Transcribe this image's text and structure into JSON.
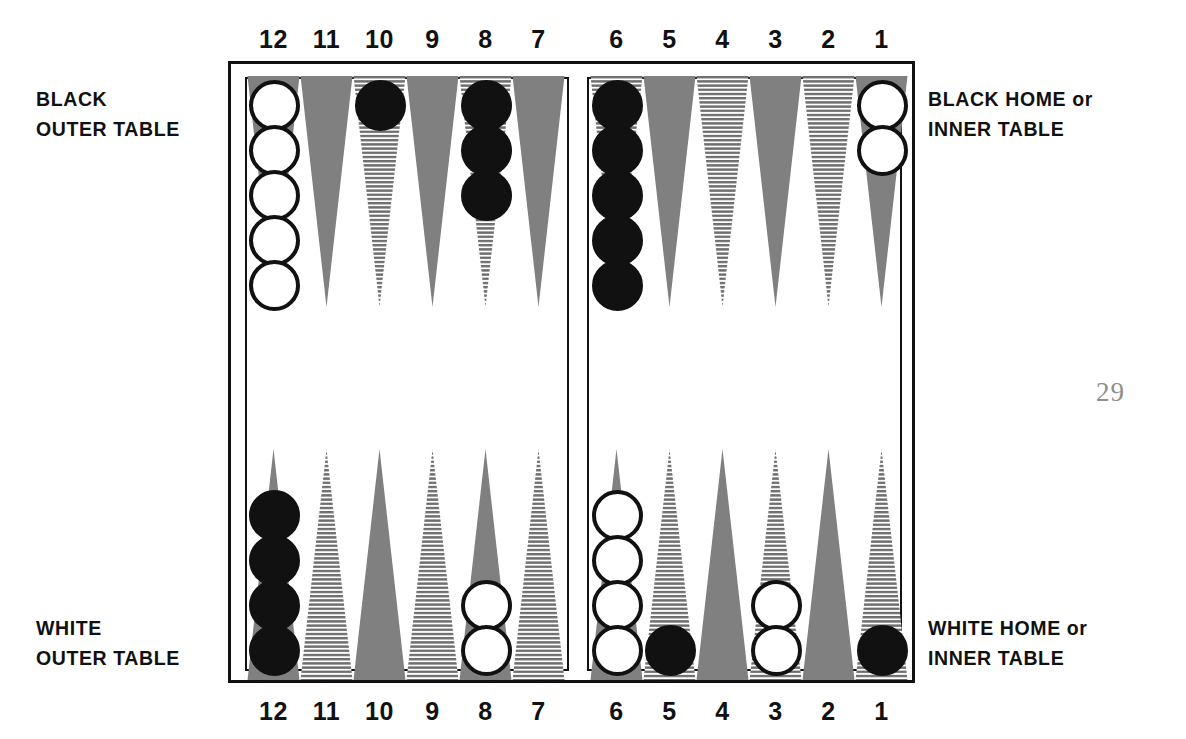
{
  "page": {
    "number": "29"
  },
  "numbers": {
    "left_quadrant": [
      "12",
      "11",
      "10",
      "9",
      "8",
      "7"
    ],
    "right_quadrant": [
      "6",
      "5",
      "4",
      "3",
      "2",
      "1"
    ]
  },
  "captions": {
    "black_outer_line1": "BLACK",
    "black_outer_line2": "OUTER TABLE",
    "black_home_line1_main": "BLACK HOME",
    "black_home_line1_or": "or",
    "black_home_line2": "INNER TABLE",
    "white_outer_line1": "WHITE",
    "white_outer_line2": "OUTER TABLE",
    "white_home_line1_main": "WHITE HOME",
    "white_home_line1_or": "or",
    "white_home_line2": "INNER TABLE"
  },
  "colors": {
    "point_solid": "#808080",
    "point_striped_line": "#6e6e6e",
    "point_striped_bg": "#ffffff",
    "checker_black": "#111111",
    "checker_white": "#ffffff",
    "outline": "#111111",
    "page_number": "#8d8d8d",
    "background": "#ffffff"
  },
  "board": {
    "quadrants": [
      {
        "name": "black-outer-table",
        "position": "top-left",
        "points": [
          {
            "number": "12",
            "fill": "solid",
            "checkers": {
              "color": "white",
              "count": 5
            }
          },
          {
            "number": "11",
            "fill": "solid",
            "checkers": {
              "color": "none",
              "count": 0
            }
          },
          {
            "number": "10",
            "fill": "striped",
            "checkers": {
              "color": "black",
              "count": 1
            }
          },
          {
            "number": "9",
            "fill": "solid",
            "checkers": {
              "color": "none",
              "count": 0
            }
          },
          {
            "number": "8",
            "fill": "striped",
            "checkers": {
              "color": "black",
              "count": 3
            }
          },
          {
            "number": "7",
            "fill": "solid",
            "checkers": {
              "color": "none",
              "count": 0
            }
          }
        ]
      },
      {
        "name": "black-home-inner-table",
        "position": "top-right",
        "points": [
          {
            "number": "6",
            "fill": "striped",
            "checkers": {
              "color": "black",
              "count": 5
            }
          },
          {
            "number": "5",
            "fill": "solid",
            "checkers": {
              "color": "none",
              "count": 0
            }
          },
          {
            "number": "4",
            "fill": "striped",
            "checkers": {
              "color": "none",
              "count": 0
            }
          },
          {
            "number": "3",
            "fill": "solid",
            "checkers": {
              "color": "none",
              "count": 0
            }
          },
          {
            "number": "2",
            "fill": "striped",
            "checkers": {
              "color": "none",
              "count": 0
            }
          },
          {
            "number": "1",
            "fill": "solid",
            "checkers": {
              "color": "white",
              "count": 2
            }
          }
        ]
      },
      {
        "name": "white-outer-table",
        "position": "bottom-left",
        "points": [
          {
            "number": "12",
            "fill": "solid",
            "checkers": {
              "color": "black",
              "count": 4
            }
          },
          {
            "number": "11",
            "fill": "striped",
            "checkers": {
              "color": "none",
              "count": 0
            }
          },
          {
            "number": "10",
            "fill": "solid",
            "checkers": {
              "color": "none",
              "count": 0
            }
          },
          {
            "number": "9",
            "fill": "striped",
            "checkers": {
              "color": "none",
              "count": 0
            }
          },
          {
            "number": "8",
            "fill": "solid",
            "checkers": {
              "color": "white",
              "count": 2
            }
          },
          {
            "number": "7",
            "fill": "striped",
            "checkers": {
              "color": "none",
              "count": 0
            }
          }
        ]
      },
      {
        "name": "white-home-inner-table",
        "position": "bottom-right",
        "points": [
          {
            "number": "6",
            "fill": "solid",
            "checkers": {
              "color": "white",
              "count": 4
            }
          },
          {
            "number": "5",
            "fill": "striped",
            "checkers": {
              "color": "black",
              "count": 1
            }
          },
          {
            "number": "4",
            "fill": "solid",
            "checkers": {
              "color": "none",
              "count": 0
            }
          },
          {
            "number": "3",
            "fill": "striped",
            "checkers": {
              "color": "white",
              "count": 2
            }
          },
          {
            "number": "2",
            "fill": "solid",
            "checkers": {
              "color": "none",
              "count": 0
            }
          },
          {
            "number": "1",
            "fill": "striped",
            "checkers": {
              "color": "black",
              "count": 1
            }
          }
        ]
      }
    ]
  }
}
